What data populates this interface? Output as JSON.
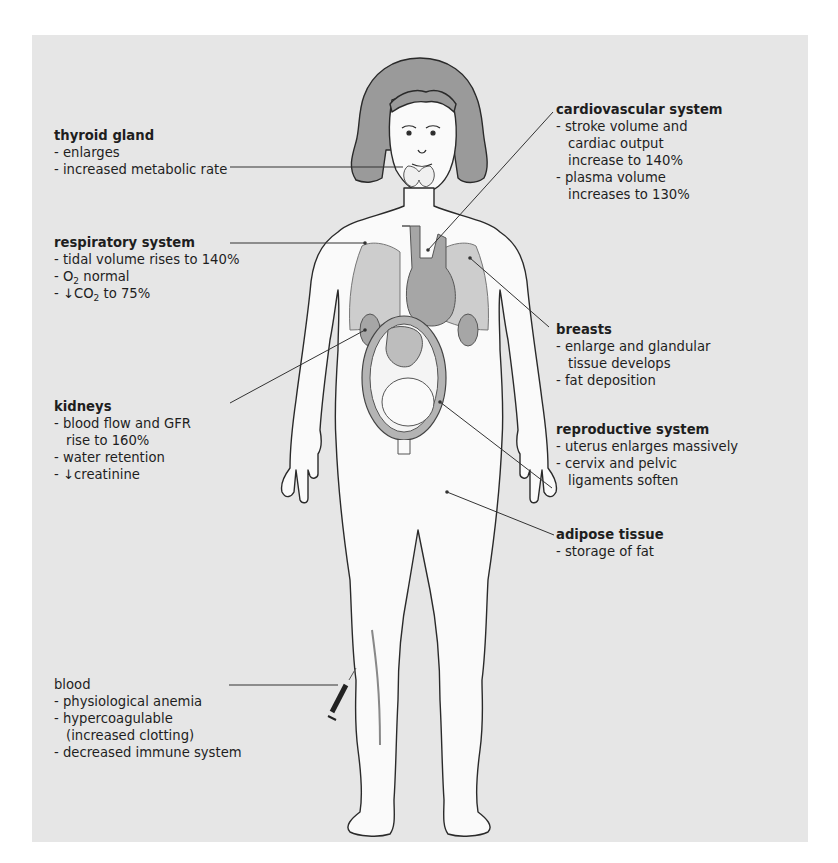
{
  "colors": {
    "panel_bg": "#e6e6e6",
    "body_fill": "#fafafa",
    "outline": "#2a2a2a",
    "hair": "#9a9a9a",
    "organ_dark": "#a6a6a6",
    "organ_light": "#cdcdcd",
    "leader_line": "#333333"
  },
  "annotations": {
    "thyroid": {
      "title": "thyroid gland",
      "items": [
        "enlarges",
        "increased metabolic rate"
      ]
    },
    "respiratory": {
      "title": "respiratory system",
      "items": [
        "tidal volume rises to 140%"
      ],
      "o2_prefix": "O",
      "o2_sub": "2",
      "o2_suffix": " normal",
      "co2_prefix": "↓CO",
      "co2_sub": "2",
      "co2_suffix": " to 75%"
    },
    "kidneys": {
      "title": "kidneys",
      "item1_line1": "blood flow and GFR",
      "item1_line2": "rise to 160%",
      "item2": "water retention",
      "item3": "↓creatinine"
    },
    "blood": {
      "title": "blood",
      "item1": "physiological anemia",
      "item2_line1": "hypercoagulable",
      "item2_line2": "(increased clotting)",
      "item3": "decreased immune system"
    },
    "cardiovascular": {
      "title": "cardiovascular system",
      "item1_line1": "stroke volume and",
      "item1_line2": "cardiac output",
      "item1_line3": "increase to 140%",
      "item2_line1": "plasma volume",
      "item2_line2": "increases to 130%"
    },
    "breasts": {
      "title": "breasts",
      "item1_line1": "enlarge and glandular",
      "item1_line2": "tissue develops",
      "item2": "fat deposition"
    },
    "reproductive": {
      "title": "reproductive system",
      "item1": "uterus enlarges massively",
      "item2_line1": "cervix and pelvic",
      "item2_line2": "ligaments soften"
    },
    "adipose": {
      "title": "adipose tissue",
      "item1": "storage of fat"
    }
  }
}
